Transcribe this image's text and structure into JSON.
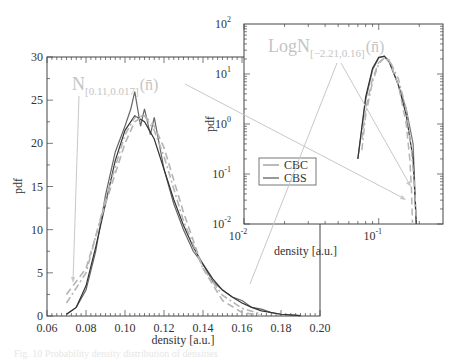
{
  "chart_data": [
    {
      "type": "line",
      "title": "",
      "xlabel": "density [a.u.]",
      "ylabel": "pdf",
      "xlim": [
        0.06,
        0.2
      ],
      "ylim": [
        0,
        30
      ],
      "xticks": [
        "0.06",
        "0.08",
        "0.10",
        "0.12",
        "0.14",
        "0.16",
        "0.18",
        "0.20"
      ],
      "yticks": [
        "0",
        "5",
        "10",
        "15",
        "20",
        "25",
        "30"
      ],
      "grid": false,
      "annotation": {
        "base": "N",
        "subscript": "[0.11,0.017]",
        "arg": "(n̄)",
        "color": "#c4c4c4"
      },
      "series": [
        {
          "name": "CBC",
          "style": "solid-noisy",
          "color": "#666666",
          "x": [
            0.07,
            0.075,
            0.08,
            0.085,
            0.09,
            0.095,
            0.1,
            0.103,
            0.105,
            0.108,
            0.11,
            0.113,
            0.115,
            0.12,
            0.125,
            0.13,
            0.135,
            0.14,
            0.145,
            0.15,
            0.155,
            0.16,
            0.165,
            0.17,
            0.175,
            0.18,
            0.19
          ],
          "y": [
            0.2,
            1.0,
            3.0,
            7.5,
            14,
            19,
            22,
            24,
            26,
            22,
            24,
            21,
            23,
            17,
            13,
            10,
            7.5,
            6,
            4,
            3,
            2.2,
            1.8,
            1.0,
            0.8,
            0.4,
            0.2,
            0.05
          ]
        },
        {
          "name": "CBS",
          "style": "solid-smooth",
          "color": "#333333",
          "x": [
            0.07,
            0.075,
            0.08,
            0.085,
            0.09,
            0.095,
            0.1,
            0.105,
            0.11,
            0.115,
            0.12,
            0.125,
            0.13,
            0.135,
            0.14,
            0.145,
            0.15,
            0.155,
            0.16,
            0.165,
            0.17,
            0.18,
            0.19
          ],
          "y": [
            0.2,
            1.0,
            3.5,
            8,
            13,
            18,
            21.5,
            23.2,
            22.5,
            20.5,
            17,
            13.5,
            10.5,
            8,
            6,
            4.3,
            3,
            2.2,
            1.5,
            1.0,
            0.6,
            0.2,
            0.05
          ]
        },
        {
          "name": "Normal fit (dashed)",
          "style": "dashed",
          "color": "#b4b4b4",
          "x": [
            0.07,
            0.08,
            0.09,
            0.1,
            0.105,
            0.11,
            0.115,
            0.12,
            0.13,
            0.14,
            0.15,
            0.16,
            0.17
          ],
          "y": [
            2.5,
            5.5,
            13,
            20,
            22.5,
            23.2,
            22.0,
            19.5,
            12,
            5.5,
            1.8,
            0.4,
            0.05
          ]
        },
        {
          "name": "LogNormal fit (dash-dot)",
          "style": "dashdot",
          "color": "#b4b4b4",
          "x": [
            0.07,
            0.08,
            0.09,
            0.1,
            0.105,
            0.11,
            0.115,
            0.12,
            0.13,
            0.14,
            0.15,
            0.16,
            0.17
          ],
          "y": [
            1.5,
            5.0,
            13.5,
            21,
            23,
            23.2,
            21.5,
            18.5,
            11,
            5.5,
            2.4,
            0.9,
            0.2
          ]
        }
      ]
    },
    {
      "type": "line",
      "title": "",
      "xlabel": "density [a.u.]",
      "ylabel": "pdf",
      "xscale": "log",
      "yscale": "log",
      "xlim": [
        0.01,
        0.3
      ],
      "ylim": [
        0.01,
        100
      ],
      "xticks": [
        "10^-2",
        "10^-1"
      ],
      "yticks": [
        "10^-2",
        "10^-1",
        "10^0",
        "10^1",
        "10^2"
      ],
      "legend": {
        "position": "left-center",
        "entries": [
          "CBC",
          "CBS"
        ]
      },
      "annotation": {
        "base": "LogN",
        "subscript": "[−2.21,0.16]",
        "arg": "(n̄)",
        "color": "#c4c4c4"
      },
      "series": [
        {
          "name": "CBC",
          "x": [
            0.07,
            0.08,
            0.09,
            0.1,
            0.11,
            0.12,
            0.14,
            0.16,
            0.18,
            0.19
          ],
          "y": [
            0.2,
            3,
            12,
            21,
            23,
            18,
            6,
            2,
            0.4,
            0.01
          ]
        },
        {
          "name": "CBS",
          "x": [
            0.07,
            0.08,
            0.09,
            0.1,
            0.11,
            0.12,
            0.14,
            0.16,
            0.18,
            0.19
          ],
          "y": [
            0.2,
            3.5,
            13,
            21.5,
            22.5,
            17,
            6,
            1.5,
            0.2,
            0.01
          ]
        }
      ]
    }
  ],
  "main": {
    "ylabel": "pdf",
    "xlabel": "density [a.u.]",
    "xticks": [
      "0.06",
      "0.08",
      "0.10",
      "0.12",
      "0.14",
      "0.16",
      "0.18",
      "0.20"
    ],
    "yticks": [
      "0",
      "5",
      "10",
      "15",
      "20",
      "25",
      "30"
    ],
    "annotation": {
      "base": "N",
      "sub": "[0.11,0.017]",
      "arg": "(n̄)"
    }
  },
  "inset": {
    "ylabel": "pdf",
    "xlabel": "density [a.u.]",
    "xticks": [
      {
        "base": "10",
        "exp": "-2"
      },
      {
        "base": "10",
        "exp": "-1"
      }
    ],
    "yticks": [
      {
        "base": "10",
        "exp": "2"
      },
      {
        "base": "10",
        "exp": "1"
      },
      {
        "base": "10",
        "exp": "0"
      },
      {
        "base": "10",
        "exp": "-1"
      },
      {
        "base": "10",
        "exp": "-2"
      }
    ],
    "legend": [
      {
        "label": "CBC",
        "color": "#777777"
      },
      {
        "label": "CBS",
        "color": "#333333"
      }
    ],
    "annotation": {
      "base": "LogN",
      "sub": "[−2.21,0.16]",
      "arg": "(n̄)"
    }
  },
  "caption": "Fig. 10 Probability density distribution of densities"
}
